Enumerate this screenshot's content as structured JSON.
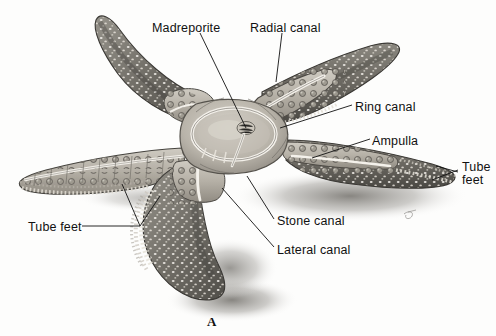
{
  "figure": {
    "letter": "A",
    "background_color": "#fdfdfc",
    "label_color": "#111111",
    "leader_color": "#111111"
  },
  "labels": [
    {
      "id": "madreporite",
      "text": "Madreporite",
      "x": 152,
      "y": 22
    },
    {
      "id": "radial-canal",
      "text": "Radial canal",
      "x": 250,
      "y": 22
    },
    {
      "id": "ring-canal",
      "text": "Ring canal",
      "x": 355,
      "y": 101
    },
    {
      "id": "ampulla",
      "text": "Ampulla",
      "x": 372,
      "y": 135
    },
    {
      "id": "tube-feet-right-line1",
      "text": "Tube",
      "x": 462,
      "y": 168
    },
    {
      "id": "tube-feet-right-line2",
      "text": "feet",
      "x": 462,
      "y": 181
    },
    {
      "id": "stone-canal",
      "text": "Stone canal",
      "x": 277,
      "y": 222
    },
    {
      "id": "lateral-canal",
      "text": "Lateral canal",
      "x": 277,
      "y": 251
    },
    {
      "id": "tube-feet-left",
      "text": "Tube feet",
      "x": 28,
      "y": 228
    }
  ],
  "anatomy": {
    "parts": [
      "madreporite",
      "radial canal",
      "ring canal",
      "ampulla",
      "tube feet",
      "stone canal",
      "lateral canal"
    ]
  }
}
